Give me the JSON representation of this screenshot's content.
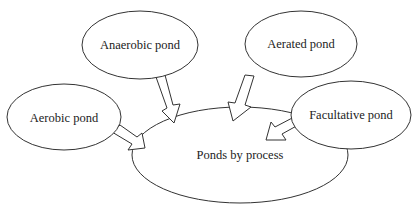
{
  "diagram": {
    "center": {
      "label": "Ponds by process"
    },
    "nodes": [
      {
        "label": "Aerobic pond"
      },
      {
        "label": "Anaerobic pond"
      },
      {
        "label": "Aerated pond"
      },
      {
        "label": "Facultative pond"
      }
    ],
    "colors": {
      "stroke": "#333333",
      "fill": "#ffffff",
      "text": "#222222"
    }
  }
}
